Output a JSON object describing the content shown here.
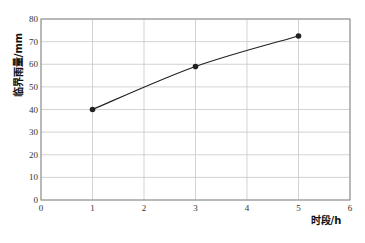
{
  "chart_data": {
    "type": "line",
    "title": "",
    "xlabel": "时段/h",
    "ylabel": "临界雨量/mm",
    "x": [
      1,
      3,
      5
    ],
    "values": [
      40,
      59,
      72.5
    ],
    "series": [
      {
        "name": "临界雨量",
        "x": [
          1,
          3,
          5
        ],
        "values": [
          40,
          59,
          72.5
        ],
        "color": "#222222",
        "marker": "circle"
      }
    ],
    "xlim": [
      0,
      6
    ],
    "ylim": [
      0,
      80
    ],
    "xticks": [
      0,
      1,
      2,
      3,
      4,
      5,
      6
    ],
    "yticks": [
      0,
      10,
      20,
      30,
      40,
      50,
      60,
      70,
      80
    ],
    "grid": true,
    "legend": "none"
  },
  "labels": {
    "xlabel": "时段/h",
    "ylabel": "临界雨量/mm"
  },
  "colors": {
    "grid": "#c8c8c8",
    "axis": "#888888",
    "line": "#222222"
  }
}
